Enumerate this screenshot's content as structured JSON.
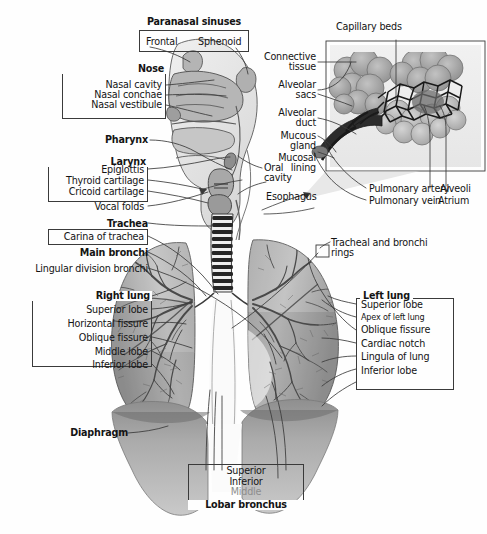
{
  "figure": {
    "type": "labeled anatomical illustration",
    "style": "grayscale medical diagram",
    "background_color": "#fefefe",
    "line_color": "#3a3a3a"
  },
  "labels": {
    "paranasal_sinuses": "Paranasal sinuses",
    "frontal": "Frontal",
    "sphenoid": "Sphenoid",
    "nose": "Nose",
    "nasal_cavity": "Nasal cavity",
    "nasal_conchae": "Nasal conchae",
    "nasal_vestibule": "Nasal vestibule",
    "pharynx": "Pharynx",
    "larynx": "Larynx",
    "epiglottis": "Epiglottis",
    "thyroid_cartilage": "Thyroid cartilage",
    "cricoid_cartilage": "Cricoid cartilage",
    "vocal_folds": "Vocal folds",
    "trachea": "Trachea",
    "carina_of_trachea": "Carina of trachea",
    "main_bronchi": "Main bronchi",
    "lingular_division_bronchi": "Lingular division bronchi",
    "right_lung": "Right lung",
    "superior_lobe_r": "Superior lobe",
    "horizontal_fissure": "Horizontal fissure",
    "oblique_fissure_r": "Oblique fissure",
    "middle_lobe": "Middle lobe",
    "inferior_lobe_r": "Inferior lobe",
    "diaphragm": "Diaphragm",
    "oral_cavity_1": "Oral",
    "oral_cavity_2": "cavity",
    "esophagus": "Esophagus",
    "tracheal_rings_1": "Tracheal and bronchi",
    "tracheal_rings_2": "rings",
    "left_lung": "Left lung",
    "superior_lobe_l": "Superior lobe",
    "apex_of_left_lung": "Apex of left lung",
    "oblique_fissure_l": "Oblique fissure",
    "cardiac_notch": "Cardiac notch",
    "lingula_of_lung": "Lingula of lung",
    "inferior_lobe_l": "Inferior lobe",
    "capillary_beds": "Capillary beds",
    "connective_1": "Connective",
    "connective_2": "tissue",
    "alveolar_sacs_1": "Alveolar",
    "alveolar_sacs_2": "sacs",
    "alveolar_duct_1": "Alveolar",
    "alveolar_duct_2": "duct",
    "mucous_gland_1": "Mucous",
    "mucous_gland_2": "gland",
    "mucosal_lining_1": "Mucosal",
    "mucosal_lining_2": "lining",
    "pulmonary_artery": "Pulmonary artery",
    "pulmonary_vein": "Pulmonary vein",
    "alveoli": "Alveoli",
    "atrium": "Atrium",
    "lobar_superior": "Superior",
    "lobar_inferior": "Inferior",
    "lobar_middle": "Middle",
    "lobar_bronchus": "Lobar bronchus"
  }
}
